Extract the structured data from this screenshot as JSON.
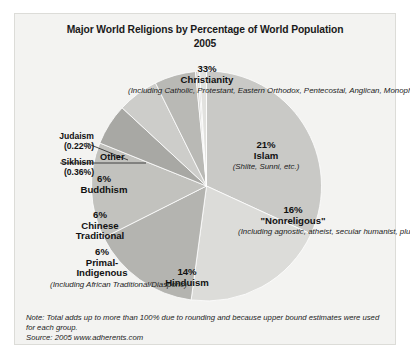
{
  "figure": {
    "title_line1": "Major World Religions by Percentage of World Population",
    "title_line2": "2005",
    "note": "Note: Total adds up to more than 100% due to rounding and because upper bound estimates were used for each group.",
    "source": "Source: 2005 www.adherents.com",
    "background": "#f3f3f1"
  },
  "chart_data": {
    "type": "pie",
    "title": "Major World Religions by Percentage of World Population 2005",
    "xlabel": "",
    "ylabel": "",
    "legend_position": "none",
    "grid": false,
    "units": "percent of world population",
    "start_angle_deg": -90,
    "direction": "clockwise",
    "categories": [
      "Christianity",
      "Islam",
      "\"Nonreligious\"",
      "Hinduism",
      "Primal-Indigenous",
      "Chinese Traditional",
      "Buddhism",
      "Sikhism",
      "Judaism",
      "Other"
    ],
    "values": [
      33,
      21,
      16,
      14,
      6,
      6,
      6,
      0.36,
      0.22,
      1.0
    ],
    "slices": [
      {
        "name": "Christianity",
        "value": 33,
        "pct_label": "33%",
        "name_label": "Christianity",
        "detail": "(Including Catholic, Protestant, Eastern Orthodox, Pentecostal, Anglican, Monophysite, AICs, Latter-day Saints, Evangelical, SDAs, Jehovah's Witnesses, Quakers, AOG, nominal, etc.)",
        "color": "#c9c9c6"
      },
      {
        "name": "Islam",
        "value": 21,
        "pct_label": "21%",
        "name_label": "Islam",
        "detail": "(Shiite, Sunni, etc.)",
        "color": "#dcdcd9"
      },
      {
        "name": "Nonreligious",
        "value": 16,
        "pct_label": "16%",
        "name_label": "\"Nonreligous\"",
        "detail": "(Including agnostic, atheist, secular humanist, plus people answering 'none' or no religious preference. Half of this group is \"theistic\" but nonreligious.)",
        "color": "#b4b4b0"
      },
      {
        "name": "Hinduism",
        "value": 14,
        "pct_label": "14%",
        "name_label": "Hinduism",
        "detail": "",
        "color": "#c2c2be"
      },
      {
        "name": "Primal-Indigenous",
        "value": 6,
        "pct_label": "6%",
        "name_label": "Primal-Indigenous",
        "detail": "(Including African Traditional/Diasporic)",
        "color": "#a8a8a4"
      },
      {
        "name": "Chinese Traditional",
        "value": 6,
        "pct_label": "6%",
        "name_label": "Chinese Traditional",
        "detail": "",
        "color": "#cdcdca"
      },
      {
        "name": "Buddhism",
        "value": 6,
        "pct_label": "6%",
        "name_label": "Buddhism",
        "detail": "",
        "color": "#b9b9b5"
      },
      {
        "name": "Sikhism",
        "value": 0.36,
        "pct_label": "(0.36%)",
        "name_label": "Sikhism",
        "detail": "",
        "color": "#d2d2cf"
      },
      {
        "name": "Judaism",
        "value": 0.22,
        "pct_label": "(0.22%)",
        "name_label": "Judaism",
        "detail": "",
        "color": "#bdbdb9"
      },
      {
        "name": "Other",
        "value": 1.0,
        "pct_label": "",
        "name_label": "Other",
        "detail": "",
        "color": "#e2e2df"
      }
    ]
  },
  "labels": {
    "christianity": {
      "pct": "33%",
      "name": "Christianity",
      "detail": "(Including Catholic, Protestant, Eastern Orthodox, Pentecostal, Anglican, Monophysite, AICs, Latter-day Saints, Evangelical, SDAs, Jehovah's Witnesses, Quakers, AOG, nominal, etc.)"
    },
    "islam": {
      "pct": "21%",
      "name": "Islam",
      "detail": "(Shiite, Sunni, etc.)"
    },
    "nonreligious": {
      "pct": "16%",
      "name": "\"Nonreligous\"",
      "detail": "(Including agnostic, atheist, secular humanist, plus people answering 'none' or no religious preference. Half of this group is \"theistic\" but nonreligious.)"
    },
    "hinduism": {
      "pct": "14%",
      "name": "Hinduism"
    },
    "primal": {
      "pct": "6%",
      "name_line1": "Primal-",
      "name_line2": "Indigenous",
      "detail": "(Including African Traditional/Diasporic)"
    },
    "chinese": {
      "pct": "6%",
      "name_line1": "Chinese",
      "name_line2": "Traditional"
    },
    "buddhism": {
      "pct": "6%",
      "name": "Buddhism"
    },
    "judaism": {
      "name": "Judaism",
      "pct": "(0.22%)"
    },
    "sikhism": {
      "name": "Sikhism",
      "pct": "(0.36%)"
    },
    "other": {
      "name": "Other"
    }
  }
}
